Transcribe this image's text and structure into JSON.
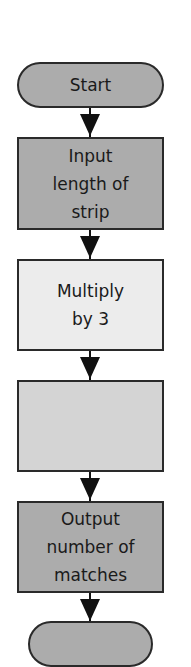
{
  "flowchart": {
    "nodes": [
      {
        "id": "start",
        "type": "terminal",
        "label": "Start",
        "fill": "#acacac",
        "top": 62,
        "height": 46
      },
      {
        "id": "input",
        "type": "process",
        "label": "Input length of strip",
        "lines": [
          "Input",
          "length of",
          "strip"
        ],
        "fill": "#acacac",
        "top": 137,
        "height": 93
      },
      {
        "id": "multiply",
        "type": "process",
        "label": "Multiply by 3",
        "lines": [
          "Multiply",
          "by 3"
        ],
        "fill": "#ececec",
        "top": 259,
        "height": 92
      },
      {
        "id": "blank",
        "type": "process",
        "label": "",
        "lines": [],
        "fill": "#d4d4d4",
        "top": 380,
        "height": 92
      },
      {
        "id": "output",
        "type": "process",
        "label": "Output number of matches",
        "lines": [
          "Output",
          "number of",
          "matches"
        ],
        "fill": "#acacac",
        "top": 501,
        "height": 92
      },
      {
        "id": "end",
        "type": "terminal",
        "label": "",
        "fill": "#acacac",
        "top": 621,
        "height": 46
      }
    ]
  }
}
